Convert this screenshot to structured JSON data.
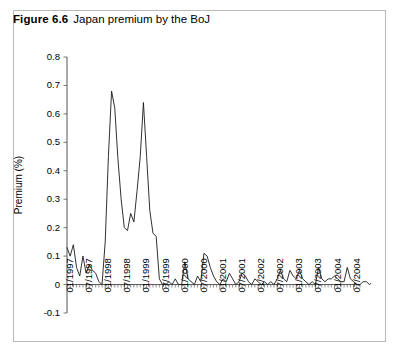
{
  "figure": {
    "label": "Figure 6.6",
    "caption": "Japan premium by the BoJ"
  },
  "chart_data": {
    "type": "line",
    "title": "Japan premium by the BoJ",
    "xlabel": "",
    "ylabel": "Premium (%)",
    "ylim": [
      -0.1,
      0.8
    ],
    "yticks": [
      0.8,
      0.7,
      0.6,
      0.5,
      0.4,
      0.3,
      0.2,
      0.1,
      0,
      -0.1
    ],
    "ytick_labels": [
      "0.8",
      "0.7",
      "0.6",
      "0.5",
      "0.4",
      "0.3",
      "0.2",
      "0.1",
      "0",
      "-0.1"
    ],
    "xtick_labels": [
      "01/1997",
      "07/1997",
      "01/1998",
      "07/1998",
      "01/1999",
      "07/1999",
      "01/2000",
      "07/2000",
      "01/2001",
      "07/2001",
      "01/2002",
      "07/2002",
      "01/2003",
      "07/2003",
      "01/2004",
      "07/2004"
    ],
    "xtick_interval_months": 6,
    "minor_tick_interval_months": 1,
    "grid": false,
    "legend": false,
    "series": [
      {
        "name": "Japan premium by the BoJ",
        "color": "#1a1a1a",
        "x_start": "01/1997",
        "x_step_months": 1,
        "values": [
          0.13,
          0.1,
          0.14,
          0.06,
          0.03,
          0.1,
          0.04,
          0.07,
          0.05,
          0.04,
          0.01,
          0.0,
          0.15,
          0.45,
          0.68,
          0.62,
          0.44,
          0.3,
          0.2,
          0.19,
          0.25,
          0.22,
          0.33,
          0.45,
          0.64,
          0.45,
          0.26,
          0.18,
          0.17,
          0.02,
          0.0,
          0.0,
          0.01,
          0.0,
          0.02,
          0.0,
          0.0,
          0.08,
          0.02,
          0.01,
          0.0,
          0.03,
          0.01,
          0.11,
          0.1,
          0.06,
          0.03,
          0.01,
          0.0,
          0.02,
          0.01,
          0.04,
          0.02,
          0.0,
          0.01,
          0.04,
          0.03,
          0.01,
          0.0,
          0.02,
          0.01,
          0.0,
          0.01,
          0.0,
          0.01,
          0.0,
          0.02,
          0.05,
          0.02,
          0.01,
          0.05,
          0.03,
          0.02,
          0.05,
          0.02,
          0.01,
          0.0,
          0.01,
          0.0,
          0.06,
          0.02,
          0.01,
          0.02,
          0.02,
          0.03,
          0.02,
          0.01,
          0.01,
          0.06,
          0.02,
          0.01,
          0.0,
          0.0,
          0.01,
          0.01,
          0.0,
          0.01,
          0.02,
          0.01,
          0.0,
          0.0,
          0.0
        ]
      }
    ]
  }
}
